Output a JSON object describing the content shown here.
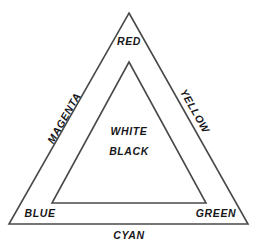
{
  "diagram": {
    "type": "nested-triangle-color-model",
    "background_color": "#ffffff",
    "stroke_color": "#4a4a4a",
    "text_color": "#17171a",
    "outer_triangle": {
      "name": "outer-triangle",
      "points": "129,13 248,224 9,224"
    },
    "inner_triangle": {
      "name": "inner-triangle",
      "points": "129,62 206,203 52,203"
    },
    "labels": {
      "red": "RED",
      "magenta": "MAGENTA",
      "yellow": "YELLOW",
      "cyan": "CYAN",
      "blue": "BLUE",
      "green": "GREEN",
      "white": "WHITE",
      "black": "BLACK"
    }
  }
}
